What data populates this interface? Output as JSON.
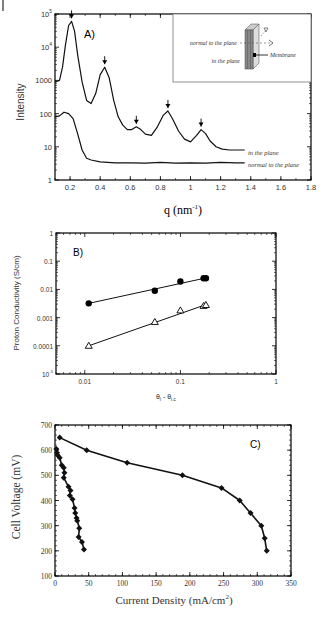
{
  "chart_data": [
    {
      "id": "A",
      "type": "line",
      "panel_label": "A)",
      "title": "",
      "xlabel": "q (nm",
      "xlabel_sup": "-1",
      "xlabel_tail": ")",
      "ylabel": "Intensity",
      "xscale": "linear",
      "yscale": "log",
      "xlim": [
        0.1,
        1.8
      ],
      "ylim": [
        1,
        100000
      ],
      "xticks": [
        0.2,
        0.4,
        0.6,
        0.8,
        1,
        1.2,
        1.4,
        1.6,
        1.8
      ],
      "xtick_labels": [
        "0.2",
        "0.4",
        "0.6",
        "0.8",
        "1",
        "1.2",
        "1.4",
        "1.6",
        "1.8"
      ],
      "yticks": [
        1,
        10,
        100,
        1000,
        10000,
        100000
      ],
      "ytick_labels": [
        "1",
        "10",
        "100",
        "1000",
        "10^4",
        "10^5"
      ],
      "series": [
        {
          "name": "in the plane",
          "x": [
            0.1,
            0.13,
            0.15,
            0.17,
            0.19,
            0.21,
            0.23,
            0.25,
            0.28,
            0.31,
            0.34,
            0.37,
            0.4,
            0.43,
            0.46,
            0.49,
            0.52,
            0.55,
            0.58,
            0.61,
            0.64,
            0.67,
            0.7,
            0.74,
            0.78,
            0.82,
            0.85,
            0.88,
            0.92,
            0.96,
            1.0,
            1.04,
            1.07,
            1.1,
            1.13,
            1.17,
            1.21,
            1.26,
            1.31,
            1.36
          ],
          "y": [
            900,
            1000,
            2500,
            12000,
            45000,
            60000,
            30000,
            6000,
            900,
            250,
            200,
            400,
            1500,
            2500,
            1200,
            250,
            80,
            45,
            33,
            33,
            40,
            33,
            24,
            22,
            40,
            90,
            120,
            70,
            30,
            17,
            14,
            22,
            33,
            25,
            15,
            10,
            8.5,
            8,
            8,
            8
          ],
          "peak_markers_q": [
            0.21,
            0.43,
            0.64,
            0.85,
            1.07
          ]
        },
        {
          "name": "normal to the plane",
          "x": [
            0.1,
            0.13,
            0.16,
            0.19,
            0.22,
            0.25,
            0.28,
            0.31,
            0.34,
            0.4,
            0.5,
            0.6,
            0.7,
            0.8,
            0.9,
            1.0,
            1.1,
            1.2,
            1.3,
            1.36
          ],
          "y": [
            80,
            85,
            110,
            100,
            70,
            25,
            8,
            4.5,
            4,
            3.5,
            3.3,
            3.3,
            3.2,
            3.4,
            3.2,
            3.3,
            3.2,
            3.4,
            3.3,
            3.3
          ]
        }
      ],
      "legend": {
        "entries": [
          "in the plane",
          "normal to the plane"
        ],
        "position": "inline, right of curve ends"
      },
      "inset": {
        "labels": [
          "normal to the plane",
          "in the plane",
          "Membrane"
        ],
        "description": "schematic of membrane slab with in-plane and normal-to-plane beam directions"
      },
      "grid": false
    },
    {
      "id": "B",
      "type": "scatter",
      "panel_label": "B)",
      "title": "",
      "xlabel": "θ_i - θ_i,c",
      "ylabel": "Proton Conductivity (S/cm)",
      "xscale": "log",
      "yscale": "log",
      "xlim": [
        0.005,
        1
      ],
      "ylim": [
        1e-05,
        1
      ],
      "xticks": [
        0.01,
        0.1,
        1
      ],
      "xtick_labels": [
        "0.01",
        "0.1",
        "1"
      ],
      "yticks": [
        1e-05,
        0.0001,
        0.001,
        0.01,
        0.1,
        1
      ],
      "ytick_labels": [
        "10^-5",
        "0.0001",
        "0.001",
        "0.01",
        "0.1",
        "1"
      ],
      "series": [
        {
          "name": "filled circles",
          "marker": "circle-filled",
          "x": [
            0.011,
            0.054,
            0.1,
            0.175,
            0.185
          ],
          "y": [
            0.0032,
            0.009,
            0.019,
            0.025,
            0.025
          ],
          "fit_line": {
            "x": [
              0.011,
              0.18
            ],
            "y": [
              0.0032,
              0.025
            ]
          }
        },
        {
          "name": "open triangles",
          "marker": "triangle-open",
          "x": [
            0.011,
            0.054,
            0.1,
            0.175,
            0.185
          ],
          "y": [
            0.0001,
            0.0007,
            0.0018,
            0.0026,
            0.0028
          ],
          "fit_line": {
            "x": [
              0.011,
              0.18
            ],
            "y": [
              0.0001,
              0.0028
            ]
          }
        }
      ],
      "grid": false
    },
    {
      "id": "C",
      "type": "line",
      "panel_label": "C)",
      "title": "",
      "xlabel": "Current Density (mA/cm",
      "xlabel_sup": "2",
      "xlabel_tail": ")",
      "ylabel": "Cell Voltage (mV)",
      "xscale": "linear",
      "yscale": "linear",
      "xlim": [
        0,
        350
      ],
      "ylim": [
        100,
        700
      ],
      "xticks": [
        0,
        50,
        100,
        150,
        200,
        250,
        300,
        350
      ],
      "xtick_labels": [
        "0",
        "50",
        "100",
        "150",
        "200",
        "250",
        "300",
        "350"
      ],
      "yticks": [
        100,
        200,
        300,
        400,
        500,
        600,
        700
      ],
      "ytick_labels": [
        "100",
        "200",
        "300",
        "400",
        "500",
        "600",
        "700"
      ],
      "series": [
        {
          "name": "high-performance cell",
          "marker": "diamond-filled",
          "x": [
            7,
            47,
            107,
            189,
            247,
            274,
            290,
            306,
            311,
            314
          ],
          "y": [
            650,
            600,
            550,
            500,
            450,
            400,
            350,
            300,
            250,
            200
          ]
        },
        {
          "name": "low-performance cell",
          "marker": "diamond-filled",
          "x": [
            2,
            3,
            4,
            7,
            10,
            13,
            14,
            13,
            20,
            23,
            22,
            26,
            29,
            30,
            32,
            33,
            36,
            35,
            40,
            43
          ],
          "y": [
            605,
            590,
            580,
            570,
            540,
            530,
            510,
            490,
            455,
            440,
            420,
            405,
            370,
            350,
            330,
            320,
            290,
            255,
            235,
            205
          ]
        }
      ],
      "grid": false
    }
  ]
}
